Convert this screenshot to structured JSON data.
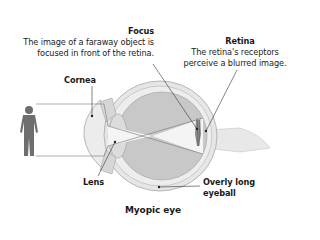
{
  "diagram": {
    "title": "Myopic eye",
    "labels": {
      "focus": {
        "heading": "Focus",
        "line1": "The image of a faraway object is",
        "line2": "focused in front of the retina."
      },
      "retina": {
        "heading": "Retina",
        "line1": "The retina's receptors",
        "line2": "perceive a blurred image."
      },
      "cornea": "Cornea",
      "lens": "Lens",
      "eyeball": {
        "line1": "Overly long",
        "line2": "eyeball"
      }
    },
    "colors": {
      "vitreous": "#c8c8c8",
      "sclera": "#e6e6e6",
      "outline": "#9a9a9a",
      "figure": "#6e6e6e",
      "light": "#f4f4f4",
      "text": "#1a1a1a"
    }
  }
}
